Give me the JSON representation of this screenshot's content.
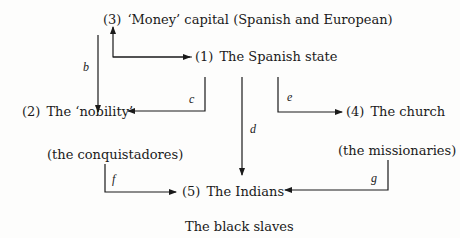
{
  "nodes": {
    "n3": {
      "num": "(3)",
      "label": "‘Money’ capital (Spanish and European)"
    },
    "n1": {
      "num": "(1)",
      "label": "The Spanish state"
    },
    "n2": {
      "num": "(2)",
      "label": "The ‘nobility’"
    },
    "n2_sub": {
      "label": "(the conquistadores)"
    },
    "n4": {
      "num": "(4)",
      "label": "The church"
    },
    "n4_sub": {
      "label": "(the missionaries)"
    },
    "n5": {
      "num": "(5)",
      "label": "The Indians"
    },
    "n6": {
      "label": "The black slaves"
    }
  },
  "edges": {
    "b": "b",
    "c": "c",
    "d": "d",
    "e": "e",
    "f": "f",
    "g": "g"
  },
  "colors": {
    "ink": "#1a1a1a",
    "background": "#fdfdfc"
  }
}
